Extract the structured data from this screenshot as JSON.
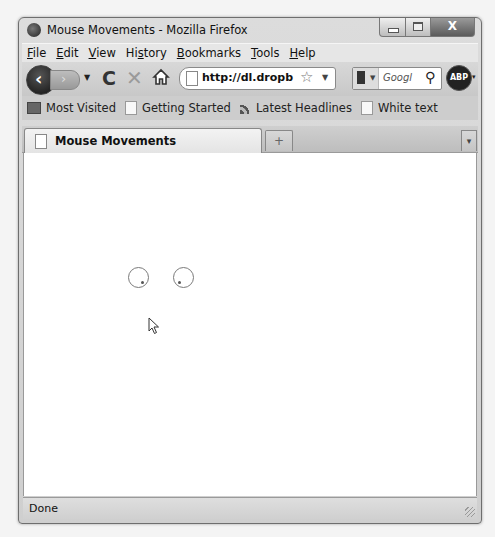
{
  "window": {
    "title": "Mouse Movements - Mozilla Firefox",
    "controls": {
      "minimize": "—",
      "maximize": "□",
      "close": "X"
    }
  },
  "menubar": {
    "items": [
      {
        "label": "File",
        "mnemonic": "F",
        "rest": "ile"
      },
      {
        "label": "Edit",
        "mnemonic": "E",
        "rest": "dit"
      },
      {
        "label": "View",
        "mnemonic": "V",
        "rest": "iew"
      },
      {
        "label": "History",
        "mnemonic": "s",
        "pre": "Hi",
        "rest": "tory"
      },
      {
        "label": "Bookmarks",
        "mnemonic": "B",
        "rest": "ookmarks"
      },
      {
        "label": "Tools",
        "mnemonic": "T",
        "rest": "ools"
      },
      {
        "label": "Help",
        "mnemonic": "H",
        "rest": "elp"
      }
    ]
  },
  "navbar": {
    "back_glyph": "‹",
    "forward_glyph": "›",
    "history_dropdown_glyph": "▼",
    "reload_glyph": "C",
    "stop_glyph": "✕",
    "url": "http://dl.dropb",
    "bookmark_star_glyph": "☆",
    "url_dropdown_glyph": "▼",
    "search_engine_dropdown_glyph": "▼",
    "search_placeholder": "Googl",
    "search_icon_glyph": "⚲",
    "adblock_label": "ABP",
    "adblock_dropdown_glyph": "▾"
  },
  "bookmarks": {
    "items": [
      {
        "label": "Most Visited",
        "icon": "folder"
      },
      {
        "label": "Getting Started",
        "icon": "page"
      },
      {
        "label": "Latest Headlines",
        "icon": "rss"
      },
      {
        "label": "White text",
        "icon": "page"
      }
    ]
  },
  "tabs": {
    "items": [
      {
        "label": "Mouse Movements",
        "active": true
      }
    ],
    "new_tab_glyph": "+",
    "list_all_glyph": "▾"
  },
  "content": {
    "eyes": [
      {
        "cx": 114,
        "cy": 124,
        "pupil_dx": 4,
        "pupil_dy": 5
      },
      {
        "cx": 159,
        "cy": 124,
        "pupil_dx": -4,
        "pupil_dy": 5
      }
    ],
    "cursor": {
      "x": 124,
      "y": 164
    }
  },
  "statusbar": {
    "text": "Done"
  }
}
